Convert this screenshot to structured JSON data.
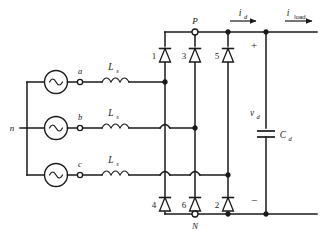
{
  "figure": {
    "kind": "circuit-schematic"
  },
  "source": {
    "neutral_label": "n",
    "phases": [
      {
        "terminal_label": "a",
        "inductor_label": "L",
        "inductor_sub": "s",
        "source_name": "ac-source-a"
      },
      {
        "terminal_label": "b",
        "inductor_label": "L",
        "inductor_sub": "s",
        "source_name": "ac-source-b"
      },
      {
        "terminal_label": "c",
        "inductor_label": "L",
        "inductor_sub": "s",
        "source_name": "ac-source-c"
      }
    ]
  },
  "bridge": {
    "top_rail_node": "P",
    "bottom_rail_node": "N",
    "diodes_top": [
      {
        "id": "1",
        "leg": "a"
      },
      {
        "id": "3",
        "leg": "b"
      },
      {
        "id": "5",
        "leg": "c"
      }
    ],
    "diodes_bottom": [
      {
        "id": "4",
        "leg": "a"
      },
      {
        "id": "6",
        "leg": "b"
      },
      {
        "id": "2",
        "leg": "c"
      }
    ]
  },
  "dc_side": {
    "capacitor_label": "C",
    "capacitor_sub": "d",
    "voltage_label": "v",
    "voltage_sub": "d",
    "polarity_plus": "+",
    "polarity_minus": "−",
    "currents": [
      {
        "label": "i",
        "sub": "d",
        "sub_style": "italic",
        "name": "dc-current-id"
      },
      {
        "label": "i",
        "sub": "load",
        "sub_style": "upright",
        "name": "dc-current-iload"
      }
    ]
  },
  "colors": {
    "ink": "#1a1a1a",
    "background": "#ffffff"
  }
}
